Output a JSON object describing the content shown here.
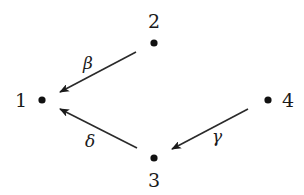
{
  "diagram": {
    "type": "directed-graph",
    "colors": {
      "background": "#ffffff",
      "ink": "#1a1a1a"
    },
    "nodes": [
      {
        "id": "1",
        "label": "1",
        "x": 42,
        "y": 100,
        "label_x": 21,
        "label_y": 100
      },
      {
        "id": "2",
        "label": "2",
        "x": 154,
        "y": 43,
        "label_x": 154,
        "label_y": 21
      },
      {
        "id": "3",
        "label": "3",
        "x": 154,
        "y": 158,
        "label_x": 154,
        "label_y": 180
      },
      {
        "id": "4",
        "label": "4",
        "x": 268,
        "y": 100,
        "label_x": 288,
        "label_y": 100
      }
    ],
    "edges": [
      {
        "from": "2",
        "to": "1",
        "label": "β",
        "x1": 136,
        "y1": 52,
        "x2": 60,
        "y2": 92,
        "label_x": 88,
        "label_y": 63
      },
      {
        "from": "3",
        "to": "1",
        "label": "δ",
        "x1": 137,
        "y1": 148,
        "x2": 60,
        "y2": 109,
        "label_x": 90,
        "label_y": 141
      },
      {
        "from": "4",
        "to": "3",
        "label": "γ",
        "x1": 248,
        "y1": 109,
        "x2": 172,
        "y2": 149,
        "label_x": 217,
        "label_y": 136
      }
    ]
  }
}
